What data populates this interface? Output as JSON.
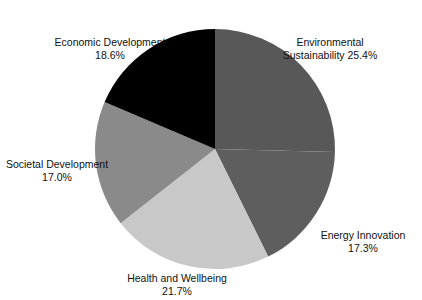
{
  "chart_data": {
    "type": "pie",
    "title": "",
    "subtitle": "",
    "xlabel": "",
    "ylabel": "",
    "legend_position": "none",
    "labels_position": "outside",
    "grid": false,
    "start_angle_deg": 0,
    "direction": "clockwise",
    "categories": [
      "Environmental Sustainability",
      "Energy Innovation",
      "Health and Wellbeing",
      "Societal Development",
      "Economic Development"
    ],
    "values": [
      25.4,
      17.3,
      21.7,
      17.0,
      18.6
    ],
    "value_suffix": "%",
    "total": 100.0,
    "slices": [
      {
        "name": "Environmental Sustainability",
        "value": 25.4,
        "value_text": "25.4%",
        "label_line1": "Environmental",
        "label_line2": "Sustainability  25.4%",
        "color": "#585858"
      },
      {
        "name": "Energy Innovation",
        "value": 17.3,
        "value_text": "17.3%",
        "label_line1": "Energy Innovation",
        "label_line2": "17.3%",
        "color": "#5e5e5e"
      },
      {
        "name": "Health and Wellbeing",
        "value": 21.7,
        "value_text": "21.7%",
        "label_line1": "Health and Wellbeing",
        "label_line2": "21.7%",
        "color": "#c8c8c8"
      },
      {
        "name": "Societal Development",
        "value": 17.0,
        "value_text": "17.0%",
        "label_line1": "Societal Development",
        "label_line2": "17.0%",
        "color": "#8a8a8a"
      },
      {
        "name": "Economic Development",
        "value": 18.6,
        "value_text": "18.6%",
        "label_line1": "Economic Development",
        "label_line2": "18.6%",
        "color": "#000000"
      }
    ],
    "geometry": {
      "center_x": 215,
      "center_y": 149,
      "radius": 120
    },
    "background_color": "#ffffff",
    "text_color": "#111111"
  },
  "top_strip": {
    "text": ""
  }
}
